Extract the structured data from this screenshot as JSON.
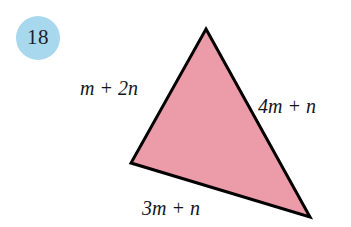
{
  "page": {
    "width": 351,
    "height": 227,
    "background_color": "#ffffff",
    "kind": "textbook-geometry-figure"
  },
  "exercise": {
    "number": "18",
    "badge_fill_color": "#a8d8ee",
    "badge_text_color": "#1c1f2b"
  },
  "figure": {
    "shape": "triangle",
    "fill_color": "#ec9ba8",
    "stroke_color": "#000000",
    "stroke_width": 3,
    "vertices": {
      "apex": {
        "x": 206,
        "y": 29
      },
      "left": {
        "x": 131,
        "y": 163
      },
      "bottom_right": {
        "x": 310,
        "y": 217
      }
    },
    "points_attr": "206,29 310,217 131,163"
  },
  "labels": {
    "left_side": "m + 2n",
    "right_side": "4m + n",
    "bottom_side": "3m + n"
  }
}
